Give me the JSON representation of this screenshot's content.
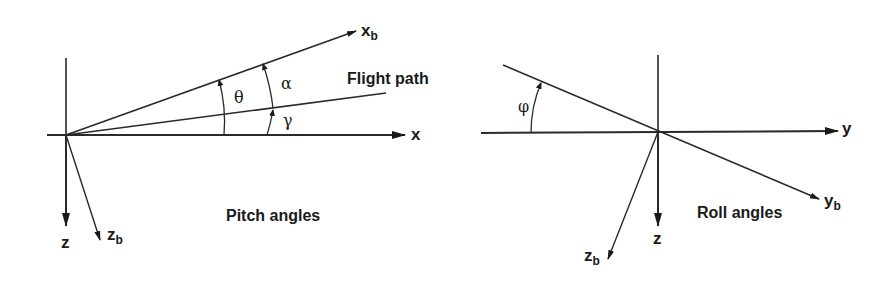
{
  "pitch_diagram": {
    "title": "Pitch angles",
    "axes": {
      "x": "x",
      "z": "z",
      "xb_main": "x",
      "xb_sub": "b",
      "zb_main": "z",
      "zb_sub": "b"
    },
    "flight_path_label": "Flight path",
    "angles": {
      "theta": "θ",
      "alpha": "α",
      "gamma": "γ"
    }
  },
  "roll_diagram": {
    "title": "Roll angles",
    "axes": {
      "y": "y",
      "z": "z",
      "yb_main": "y",
      "yb_sub": "b",
      "zb_main": "z",
      "zb_sub": "b"
    },
    "angles": {
      "phi": "φ"
    }
  },
  "colors": {
    "line": "#2a2a2a",
    "background": "#ffffff"
  }
}
